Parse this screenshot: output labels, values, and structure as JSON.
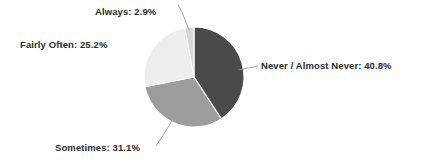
{
  "chart_data": {
    "type": "pie",
    "title": "",
    "subtitle": "",
    "xlabel": "",
    "ylabel": "",
    "legend_position": "none",
    "grid": false,
    "labels_format": "{category}: {value}%",
    "start_angle_deg": 0,
    "direction": "clockwise",
    "categories": [
      "Never / Almost Never",
      "Sometimes",
      "Fairly Often",
      "Always"
    ],
    "values": [
      40.8,
      31.1,
      25.2,
      2.9
    ],
    "slices": [
      {
        "category": "Never / Almost Never",
        "value": 40.8,
        "label": "Never / Almost Never: 40.8%",
        "color": "#4a4a4a",
        "start_deg": 0.0,
        "end_deg": 146.9
      },
      {
        "category": "Sometimes",
        "value": 31.1,
        "label": "Sometimes: 31.1%",
        "color": "#9d9d9d",
        "start_deg": 146.9,
        "end_deg": 258.8
      },
      {
        "category": "Fairly Often",
        "value": 25.2,
        "label": "Fairly Often: 25.2%",
        "color": "#ededed",
        "start_deg": 258.8,
        "end_deg": 349.5
      },
      {
        "category": "Always",
        "value": 2.9,
        "label": "Always: 2.9%",
        "color": "#d6d6d6",
        "start_deg": 349.5,
        "end_deg": 360.0
      }
    ]
  },
  "labels": {
    "always": "Always: 2.9%",
    "fairly_often": "Fairly Often: 25.2%",
    "never_almost_never": "Never / Almost Never: 40.8%",
    "sometimes": "Sometimes: 31.1%"
  },
  "colors": {
    "background": "#ffffff",
    "text": "#2b2b2b",
    "leader_line": "#9a9a9a",
    "slice_outline": "#ffffff",
    "never_almost_never": "#4a4a4a",
    "sometimes": "#9d9d9d",
    "fairly_often": "#ededed",
    "always": "#d6d6d6"
  }
}
